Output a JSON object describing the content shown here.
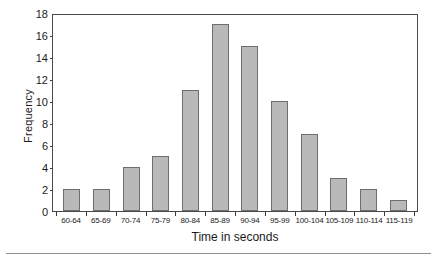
{
  "chart_data": {
    "type": "bar",
    "title": "",
    "subtitle": "",
    "xlabel": "Time in seconds",
    "ylabel": "Frequency",
    "categories": [
      "60-64",
      "65-69",
      "70-74",
      "75-79",
      "80-84",
      "85-89",
      "90-94",
      "95-99",
      "100-104",
      "105-109",
      "110-114",
      "115-119"
    ],
    "values": [
      2,
      2,
      4,
      5,
      11,
      17,
      15,
      10,
      7,
      3,
      2,
      1
    ],
    "ylim": [
      0,
      18
    ],
    "ytick_values": [
      0,
      2,
      4,
      6,
      8,
      10,
      12,
      14,
      16,
      18
    ],
    "ytick_labels": [
      "0",
      "2",
      "4",
      "6",
      "8",
      "10",
      "12",
      "14",
      "16",
      "18"
    ],
    "grid": false,
    "legend": false,
    "legend_position": "none",
    "bar_fill_color": "#b9b9b9",
    "bar_edge_color": "#6e6e6e",
    "axis_color": "#4a4a4a",
    "background_color": "#ffffff"
  }
}
